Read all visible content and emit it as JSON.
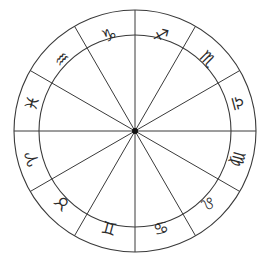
{
  "chart_data": {
    "type": "pie",
    "xlabel": "",
    "ylabel": "",
    "grid": false,
    "legend": "none",
    "geometry": {
      "center_x": 135,
      "center_y": 131,
      "outer_radius": 121,
      "inner_radius": 96,
      "hub_radius": 3,
      "segments": 12,
      "segment_degrees": 30,
      "start_angle_deg": 90
    },
    "colors": {
      "background": "#ffffff",
      "line": "#3a3a3a",
      "glyph": "#2b2b2b",
      "hub": "#111111"
    },
    "categories": [
      "Sagittarius",
      "Scorpio",
      "Libra",
      "Virgo",
      "Leo",
      "Cancer",
      "Gemini",
      "Taurus",
      "Aries",
      "Pisces",
      "Aquarius",
      "Capricorn"
    ],
    "values": [
      30,
      30,
      30,
      30,
      30,
      30,
      30,
      30,
      30,
      30,
      30,
      30
    ],
    "signs": [
      {
        "name": "Sagittarius",
        "glyph": "♐",
        "mid_angle_deg": 75,
        "x": 161,
        "y": 35
      },
      {
        "name": "Scorpio",
        "glyph": "♏",
        "mid_angle_deg": 45,
        "x": 208,
        "y": 59
      },
      {
        "name": "Libra",
        "glyph": "♎",
        "mid_angle_deg": 15,
        "x": 238,
        "y": 103
      },
      {
        "name": "Virgo",
        "glyph": "♍",
        "mid_angle_deg": -15,
        "x": 238,
        "y": 159
      },
      {
        "name": "Leo",
        "glyph": "♌",
        "mid_angle_deg": -45,
        "x": 208,
        "y": 203
      },
      {
        "name": "Cancer",
        "glyph": "♋",
        "mid_angle_deg": -75,
        "x": 161,
        "y": 228
      },
      {
        "name": "Gemini",
        "glyph": "♊",
        "mid_angle_deg": -105,
        "x": 109,
        "y": 228
      },
      {
        "name": "Taurus",
        "glyph": "♉",
        "mid_angle_deg": -135,
        "x": 62,
        "y": 203
      },
      {
        "name": "Aries",
        "glyph": "♈",
        "mid_angle_deg": -165,
        "x": 32,
        "y": 159
      },
      {
        "name": "Pisces",
        "glyph": "♓",
        "mid_angle_deg": 165,
        "x": 32,
        "y": 103
      },
      {
        "name": "Aquarius",
        "glyph": "♒",
        "mid_angle_deg": 135,
        "x": 62,
        "y": 59
      },
      {
        "name": "Capricorn",
        "glyph": "♑",
        "mid_angle_deg": 105,
        "x": 109,
        "y": 35
      }
    ],
    "divider_angles_deg": [
      0,
      30,
      60,
      90,
      120,
      150,
      180,
      210,
      240,
      270,
      300,
      330
    ]
  }
}
